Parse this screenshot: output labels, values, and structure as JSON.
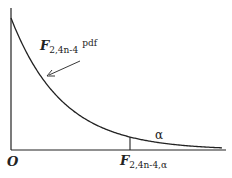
{
  "diagram": {
    "type": "probability-density-function",
    "curve_label": {
      "symbol": "F",
      "subscript": "2,4n-4",
      "suffix": "pdf"
    },
    "tail_area_label": "α",
    "origin_label": "O",
    "critical_value_label": {
      "symbol": "F",
      "subscript": "2,4n-4,α"
    },
    "colors": {
      "line": "#222222",
      "background": "#ffffff"
    }
  }
}
